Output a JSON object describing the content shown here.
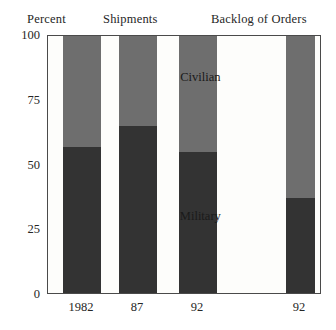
{
  "headers": {
    "percent": "Percent",
    "shipments": "Shipments",
    "backlog": "Backlog of Orders"
  },
  "colors": {
    "military": "#333333",
    "civilian": "#6e6e6e",
    "frame": "#4a4a4a",
    "background": "#ffffff",
    "plot_background": "#fdfdfb",
    "text": "#262626"
  },
  "chart_data": {
    "type": "bar",
    "title": "Percent",
    "subtitle_left": "Shipments",
    "subtitle_right": "Backlog of Orders",
    "stacked": true,
    "stacked_total": 100,
    "xlabel": "",
    "ylabel": "Percent",
    "ylim": [
      0,
      100
    ],
    "yticks": [
      0,
      25,
      50,
      75,
      100
    ],
    "ytick_labels": [
      "0",
      "25",
      "50",
      "75",
      "100"
    ],
    "grid": false,
    "legend": "in-plot annotations",
    "categories": [
      "1982",
      "87",
      "92",
      "92"
    ],
    "groups": [
      {
        "name": "Shipments",
        "categories": [
          "1982",
          "87",
          "92"
        ]
      },
      {
        "name": "Backlog of Orders",
        "categories": [
          "92"
        ]
      }
    ],
    "series": [
      {
        "name": "Military",
        "color": "#333333",
        "values": [
          57,
          65,
          55,
          37
        ]
      },
      {
        "name": "Civilian",
        "color": "#6e6e6e",
        "values": [
          43,
          35,
          45,
          63
        ]
      }
    ],
    "annotations": [
      {
        "text": "Civilian",
        "x_pct": 56,
        "y_value": 84
      },
      {
        "text": "Military",
        "x_pct": 56,
        "y_value": 30
      }
    ]
  },
  "bars": [
    {
      "label": "1982",
      "group": "Shipments",
      "military": 57,
      "civilian": 43,
      "left_px": 62,
      "width_px": 38
    },
    {
      "label": "87",
      "group": "Shipments",
      "military": 65,
      "civilian": 35,
      "left_px": 118,
      "width_px": 38
    },
    {
      "label": "92",
      "group": "Shipments",
      "military": 55,
      "civilian": 45,
      "left_px": 178,
      "width_px": 38
    },
    {
      "label": "92",
      "group": "Backlog of Orders",
      "military": 37,
      "civilian": 63,
      "left_px": 285,
      "width_px": 29
    }
  ],
  "axis": {
    "tick_100": "100",
    "tick_75": "75",
    "tick_50": "50",
    "tick_25": "25",
    "tick_0": "0"
  },
  "labels": {
    "civilian": "Civilian",
    "military": "Military",
    "x1": "1982",
    "x2": "87",
    "x3": "92",
    "x4": "92"
  }
}
